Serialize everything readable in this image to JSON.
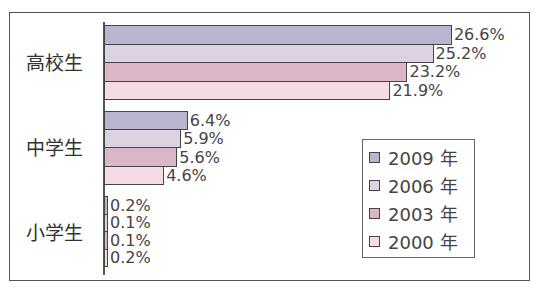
{
  "chart_data": {
    "type": "bar",
    "orientation": "horizontal",
    "title": "",
    "xlabel": "",
    "ylabel": "",
    "categories": [
      "高校生",
      "中学生",
      "小学生"
    ],
    "series": [
      {
        "name": "2009 年",
        "color": "#b9b5d0",
        "values": [
          26.6,
          6.4,
          0.2
        ]
      },
      {
        "name": "2006 年",
        "color": "#dcd2e2",
        "values": [
          25.2,
          5.9,
          0.1
        ]
      },
      {
        "name": "2003 年",
        "color": "#dbb6c8",
        "values": [
          23.2,
          5.6,
          0.1
        ]
      },
      {
        "name": "2000 年",
        "color": "#f6dbe5",
        "values": [
          21.9,
          4.6,
          0.2
        ]
      }
    ],
    "value_labels": [
      [
        "26.6%",
        "25.2%",
        "23.2%",
        "21.9%"
      ],
      [
        "6.4%",
        "5.9%",
        "5.6%",
        "4.6%"
      ],
      [
        "0.2%",
        "0.1%",
        "0.1%",
        "0.2%"
      ]
    ],
    "unit": "%",
    "grid": false,
    "legend_position": "lower-right inside"
  },
  "labels": {
    "high": "高校生",
    "middle": "中学生",
    "elementary": "小学生"
  },
  "legend": [
    "2009 年",
    "2006 年",
    "2003 年",
    "2000 年"
  ]
}
